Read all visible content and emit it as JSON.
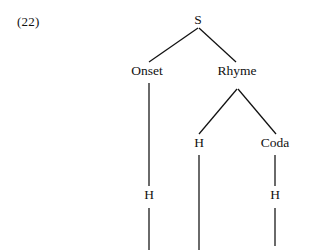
{
  "figure": {
    "example_number": "(22)",
    "ink_color": "#111111",
    "background_color": "#ffffff"
  },
  "tree": {
    "nodes": [
      {
        "id": "root",
        "label": "S",
        "x": 198,
        "y": 13,
        "role": "syllable-node"
      },
      {
        "id": "onset",
        "label": "Onset",
        "x": 147,
        "y": 64,
        "role": "onset-node"
      },
      {
        "id": "rhyme",
        "label": "Rhyme",
        "x": 237,
        "y": 64,
        "role": "rhyme-node"
      },
      {
        "id": "nucleus",
        "label": "H",
        "x": 199,
        "y": 136,
        "role": "nucleus-node"
      },
      {
        "id": "coda",
        "label": "Coda",
        "x": 275,
        "y": 136,
        "role": "coda-node"
      },
      {
        "id": "onsetseg",
        "label": "H",
        "x": 149,
        "y": 188,
        "role": "onset-segment-node"
      },
      {
        "id": "codaseg",
        "label": "H",
        "x": 275,
        "y": 188,
        "role": "coda-segment-node"
      }
    ],
    "edges": [
      {
        "id": "root-onset",
        "from": "root",
        "to": "onset",
        "x1": 198,
        "y1": 28,
        "x2": 149,
        "y2": 62
      },
      {
        "id": "root-rhyme",
        "from": "root",
        "to": "rhyme",
        "x1": 199,
        "y1": 28,
        "x2": 236,
        "y2": 62
      },
      {
        "id": "rhyme-nucleus",
        "from": "rhyme",
        "to": "nucleus",
        "x1": 237,
        "y1": 89,
        "x2": 199,
        "y2": 134
      },
      {
        "id": "rhyme-coda",
        "from": "rhyme",
        "to": "coda",
        "x1": 238,
        "y1": 89,
        "x2": 276,
        "y2": 134
      },
      {
        "id": "onset-segment",
        "from": "onset",
        "to": "onsetseg",
        "x1": 149,
        "y1": 83,
        "x2": 149,
        "y2": 186
      },
      {
        "id": "nucleus-stem",
        "from": "nucleus",
        "to": "tier",
        "x1": 199,
        "y1": 155,
        "x2": 199,
        "y2": 250
      },
      {
        "id": "coda-segment",
        "from": "coda",
        "to": "codaseg",
        "x1": 275,
        "y1": 155,
        "x2": 275,
        "y2": 186
      },
      {
        "id": "onset-stem",
        "from": "onsetseg",
        "to": "tier",
        "x1": 149,
        "y1": 208,
        "x2": 149,
        "y2": 250
      },
      {
        "id": "coda-stem",
        "from": "codaseg",
        "to": "tier",
        "x1": 275,
        "y1": 208,
        "x2": 275,
        "y2": 246
      }
    ]
  }
}
